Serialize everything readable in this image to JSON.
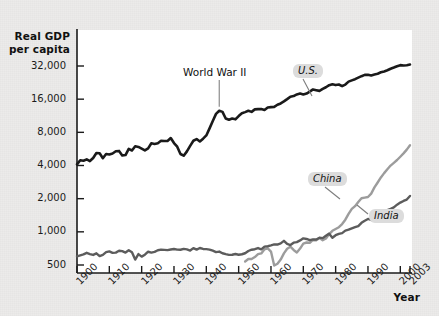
{
  "figure": {
    "background_color": "#ecebea",
    "plot_background_color": "#ffffff",
    "axis_color": "#1b1b1b"
  },
  "labels": {
    "y_axis_title_line1": "Real GDP",
    "y_axis_title_line2": "per capita",
    "x_axis_title": "Year",
    "annotation_ww2": "World War II",
    "series_us": "U.S.",
    "series_china": "China",
    "series_india": "India"
  },
  "chart_data": {
    "type": "line",
    "title": "",
    "xlabel": "Year",
    "ylabel": "Real GDP per capita",
    "yscale": "log2",
    "ylim": [
      430,
      40000
    ],
    "xlim": [
      1900,
      2003
    ],
    "grid": false,
    "legend": "inline-labels",
    "y_ticks": [
      500,
      1000,
      2000,
      4000,
      8000,
      16000,
      32000
    ],
    "y_tick_labels": [
      "500",
      "1,000",
      "2,000",
      "4,000",
      "8,000",
      "16,000",
      "32,000"
    ],
    "x_ticks": [
      1900,
      1910,
      1920,
      1930,
      1940,
      1950,
      1960,
      1970,
      1980,
      1990,
      2000,
      2003
    ],
    "x_tick_labels": [
      "1900",
      "1910",
      "1920",
      "1930",
      "1940",
      "1950",
      "1960",
      "1970",
      "1980",
      "1990",
      "2000",
      "2003"
    ],
    "annotations": [
      {
        "text": "World War II",
        "x": 1944,
        "y": 12500,
        "leader_to": [
          1944,
          11500
        ]
      }
    ],
    "series": [
      {
        "name": "U.S.",
        "color": "#1a1a1a",
        "width": 2.6,
        "label_at": [
          1962,
          22000
        ],
        "x": [
          1900,
          1901,
          1902,
          1903,
          1904,
          1905,
          1906,
          1907,
          1908,
          1909,
          1910,
          1911,
          1912,
          1913,
          1914,
          1915,
          1916,
          1917,
          1918,
          1919,
          1920,
          1921,
          1922,
          1923,
          1924,
          1925,
          1926,
          1927,
          1928,
          1929,
          1930,
          1931,
          1932,
          1933,
          1934,
          1935,
          1936,
          1937,
          1938,
          1939,
          1940,
          1941,
          1942,
          1943,
          1944,
          1945,
          1946,
          1947,
          1948,
          1949,
          1950,
          1951,
          1952,
          1953,
          1954,
          1955,
          1956,
          1957,
          1958,
          1959,
          1960,
          1961,
          1962,
          1963,
          1964,
          1965,
          1966,
          1967,
          1968,
          1969,
          1970,
          1971,
          1972,
          1973,
          1974,
          1975,
          1976,
          1977,
          1978,
          1979,
          1980,
          1981,
          1982,
          1983,
          1984,
          1985,
          1986,
          1987,
          1988,
          1989,
          1990,
          1991,
          1992,
          1993,
          1994,
          1995,
          1996,
          1997,
          1998,
          1999,
          2000,
          2001,
          2002,
          2003
        ],
        "y": [
          4091,
          4464,
          4421,
          4551,
          4389,
          4682,
          5187,
          5167,
          4658,
          5083,
          5028,
          5136,
          5384,
          5425,
          4930,
          4976,
          5660,
          5476,
          5978,
          5895,
          5688,
          5484,
          5718,
          6369,
          6277,
          6368,
          6700,
          6684,
          6681,
          7099,
          6393,
          5927,
          5088,
          4908,
          5374,
          6030,
          6710,
          6950,
          6609,
          7010,
          7501,
          8687,
          10136,
          11773,
          12573,
          12262,
          10673,
          10402,
          10671,
          10492,
          11240,
          11934,
          12207,
          12562,
          12270,
          12932,
          13001,
          12998,
          12756,
          13450,
          13550,
          13618,
          14235,
          14634,
          15263,
          16006,
          16845,
          17068,
          17669,
          17996,
          17663,
          17992,
          18742,
          19610,
          19300,
          19022,
          19811,
          20524,
          21424,
          21836,
          21473,
          21738,
          20995,
          21709,
          23074,
          23703,
          24301,
          25096,
          25869,
          26566,
          26682,
          26288,
          26805,
          27250,
          28060,
          28556,
          29279,
          30220,
          31004,
          31883,
          32572,
          32324,
          32523,
          32996
        ]
      },
      {
        "name": "China",
        "color": "#9c9c9c",
        "width": 2.4,
        "label_at": [
          1978,
          2250
        ],
        "x": [
          1952,
          1953,
          1954,
          1955,
          1956,
          1957,
          1958,
          1959,
          1960,
          1961,
          1962,
          1963,
          1964,
          1965,
          1966,
          1967,
          1968,
          1969,
          1970,
          1971,
          1972,
          1973,
          1974,
          1975,
          1976,
          1977,
          1978,
          1979,
          1980,
          1981,
          1982,
          1983,
          1984,
          1985,
          1986,
          1987,
          1988,
          1989,
          1990,
          1991,
          1992,
          1993,
          1994,
          1995,
          1996,
          1997,
          1998,
          1999,
          2000,
          2001,
          2002,
          2003
        ],
        "y": [
          538,
          567,
          566,
          590,
          628,
          637,
          695,
          709,
          662,
          494,
          514,
          560,
          638,
          702,
          733,
          685,
          650,
          705,
          783,
          800,
          795,
          844,
          838,
          880,
          840,
          869,
          954,
          1022,
          1061,
          1101,
          1176,
          1289,
          1454,
          1614,
          1709,
          1862,
          2016,
          2046,
          2069,
          2224,
          2530,
          2803,
          3118,
          3411,
          3701,
          3996,
          4228,
          4485,
          4803,
          5155,
          5574,
          6100
        ]
      },
      {
        "name": "India",
        "color": "#5c5c5c",
        "width": 2.4,
        "label_at": [
          1989,
          1500
        ],
        "x": [
          1900,
          1901,
          1902,
          1903,
          1904,
          1905,
          1906,
          1907,
          1908,
          1909,
          1910,
          1911,
          1912,
          1913,
          1914,
          1915,
          1916,
          1917,
          1918,
          1919,
          1920,
          1921,
          1922,
          1923,
          1924,
          1925,
          1926,
          1927,
          1928,
          1929,
          1930,
          1931,
          1932,
          1933,
          1934,
          1935,
          1936,
          1937,
          1938,
          1939,
          1940,
          1941,
          1942,
          1943,
          1944,
          1945,
          1946,
          1947,
          1948,
          1949,
          1950,
          1951,
          1952,
          1953,
          1954,
          1955,
          1956,
          1957,
          1958,
          1959,
          1960,
          1961,
          1962,
          1963,
          1964,
          1965,
          1966,
          1967,
          1968,
          1969,
          1970,
          1971,
          1972,
          1973,
          1974,
          1975,
          1976,
          1977,
          1978,
          1979,
          1980,
          1981,
          1982,
          1983,
          1984,
          1985,
          1986,
          1987,
          1988,
          1989,
          1990,
          1991,
          1992,
          1993,
          1994,
          1995,
          1996,
          1997,
          1998,
          1999,
          2000,
          2001,
          2002,
          2003
        ],
        "y": [
          599,
          612,
          624,
          645,
          628,
          617,
          638,
          602,
          618,
          654,
          664,
          644,
          648,
          673,
          668,
          648,
          681,
          652,
          560,
          628,
          596,
          620,
          660,
          648,
          658,
          681,
          689,
          686,
          682,
          691,
          699,
          690,
          688,
          701,
          693,
          676,
          712,
          689,
          713,
          699,
          697,
          690,
          674,
          654,
          662,
          639,
          627,
          618,
          619,
          629,
          619,
          626,
          639,
          670,
          688,
          695,
          713,
          694,
          735,
          740,
          753,
          768,
          767,
          786,
          828,
          776,
          759,
          797,
          806,
          836,
          873,
          861,
          840,
          854,
          852,
          885,
          877,
          923,
          963,
          885,
          932,
          958,
          974,
          1026,
          1047,
          1077,
          1104,
          1128,
          1207,
          1262,
          1309,
          1282,
          1332,
          1363,
          1425,
          1495,
          1578,
          1617,
          1669,
          1764,
          1842,
          1907,
          1964,
          2116
        ]
      }
    ]
  }
}
